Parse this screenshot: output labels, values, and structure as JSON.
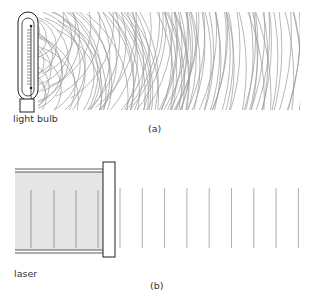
{
  "panel_a": {
    "caption": "(a)",
    "source_label": "light bulb",
    "description": "Incoherent light: randomly phased circular wavefronts emanating from a filament"
  },
  "panel_b": {
    "caption": "(b)",
    "source_label": "laser",
    "description": "Coherent light: evenly spaced plane wavefronts leaving a laser through its end mirror"
  },
  "colors": {
    "line": "#222222",
    "wave": "#9a9a9a",
    "laser_fill": "#e6e6e6"
  }
}
